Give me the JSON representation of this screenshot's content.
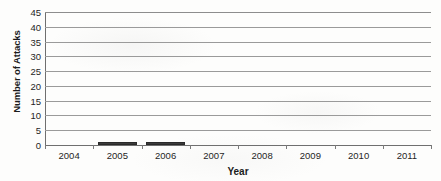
{
  "chart_data": {
    "type": "bar",
    "title": "",
    "xlabel": "Year",
    "ylabel": "Number of Attacks",
    "categories": [
      "2004",
      "2005",
      "2006",
      "2007",
      "2008",
      "2009",
      "2010",
      "2011"
    ],
    "values": [
      0,
      1,
      1,
      0,
      0,
      0,
      0,
      0
    ],
    "series": [
      {
        "name": "Number of Attacks",
        "values": [
          0,
          1,
          1,
          0,
          0,
          0,
          0,
          0
        ]
      }
    ],
    "ylim": [
      0,
      45
    ],
    "ytick_values": [
      0,
      5,
      10,
      15,
      20,
      25,
      30,
      35,
      40,
      45
    ],
    "ytick_labels": [
      "0",
      "5",
      "10",
      "15",
      "20",
      "25",
      "30",
      "35",
      "40",
      "45"
    ],
    "xtick_labels": [
      "2004",
      "2005",
      "2006",
      "2007",
      "2008",
      "2009",
      "2010",
      "2011"
    ],
    "grid": true,
    "grid_axis": "y",
    "legend": false,
    "legend_position": "none",
    "bar_color": "#3b3b3b",
    "grid_color": "#9a9a9a",
    "axis_color": "#6f6f6f",
    "background_color": "#fdfdfc",
    "annotations": []
  }
}
